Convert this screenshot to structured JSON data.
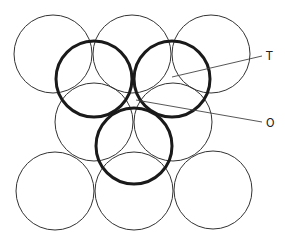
{
  "diagram": {
    "type": "close-packed sphere layers (interstitial sites)",
    "colors": {
      "thin_stroke": "#333333",
      "thick_stroke": "#1a1a1a",
      "leader": "#444444"
    },
    "thin_circles": [
      {
        "cx": 53,
        "cy": 54,
        "r": 39
      },
      {
        "cx": 132,
        "cy": 54,
        "r": 39
      },
      {
        "cx": 211,
        "cy": 54,
        "r": 39
      },
      {
        "cx": 94,
        "cy": 122,
        "r": 39
      },
      {
        "cx": 173,
        "cy": 122,
        "r": 39
      },
      {
        "cx": 55,
        "cy": 191,
        "r": 39
      },
      {
        "cx": 134,
        "cy": 191,
        "r": 39
      },
      {
        "cx": 213,
        "cy": 190,
        "r": 39
      }
    ],
    "thick_circles": [
      {
        "cx": 94,
        "cy": 79,
        "r": 38
      },
      {
        "cx": 172,
        "cy": 79,
        "r": 38
      },
      {
        "cx": 134,
        "cy": 146,
        "r": 38
      }
    ],
    "labels": [
      {
        "text": "T",
        "x": 266,
        "y": 60,
        "line": {
          "x1": 172,
          "y1": 77,
          "x2": 262,
          "y2": 56
        }
      },
      {
        "text": "O",
        "x": 266,
        "y": 127,
        "line": {
          "x1": 136,
          "y1": 100,
          "x2": 262,
          "y2": 122
        }
      }
    ]
  }
}
